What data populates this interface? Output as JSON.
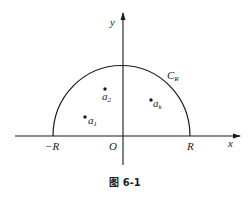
{
  "figure": {
    "caption": "图 6-1",
    "axes": {
      "x_label": "x",
      "y_label": "y",
      "origin_label": "O"
    },
    "contour": {
      "label": "C",
      "label_sub": "R",
      "shape": "upper semicircle"
    },
    "ticks": {
      "neg_R": "−R",
      "pos_R": "R"
    },
    "points": [
      {
        "name": "a",
        "sub": "1"
      },
      {
        "name": "a",
        "sub": "2"
      },
      {
        "name": "a",
        "sub": "k"
      }
    ],
    "colors": {
      "stroke": "#1a1a1a",
      "background": "#ffffff"
    }
  }
}
